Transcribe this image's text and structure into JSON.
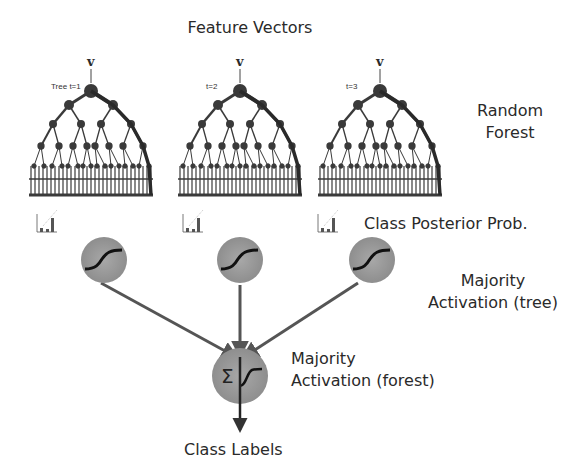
{
  "title": "Feature Vectors",
  "input_symbol": "v",
  "trees": [
    {
      "label": "Tree t=1",
      "x": 91
    },
    {
      "label": "t=2",
      "x": 240
    },
    {
      "label": "t=3",
      "x": 380
    }
  ],
  "labels": {
    "random_forest_line1": "Random",
    "random_forest_line2": "Forest",
    "class_posterior": "Class Posterior Prob.",
    "majority_tree_line1": "Majority",
    "majority_tree_line2": "Activation (tree)",
    "majority_forest_line1": "Majority",
    "majority_forest_line2": "Activation (forest)",
    "class_labels": "Class Labels",
    "sum_symbol": "Σ"
  },
  "colors": {
    "tree": "#3a3a3a",
    "node_fill": "#9a9a9a",
    "arrow": "#555555",
    "curve": "#111111"
  }
}
